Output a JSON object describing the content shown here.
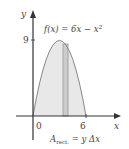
{
  "figure": {
    "function_label": "f(x) = 6x − x²",
    "function_label_parts": {
      "f": "f(x) = 6x − x",
      "exp": "2"
    },
    "y_axis_label": "y",
    "x_axis_label": "x",
    "y_tick": "9",
    "x_tick_origin": "0",
    "x_tick_end": "6",
    "area_formula": {
      "A": "A",
      "sub": "rect.",
      "rest": " = y Δx"
    }
  },
  "colors": {
    "axis": "#333333",
    "curve": "#888888",
    "fill": "#e8e8e8",
    "rect_fill": "#cccccc",
    "rect_stroke": "#999999",
    "text": "#444444"
  }
}
